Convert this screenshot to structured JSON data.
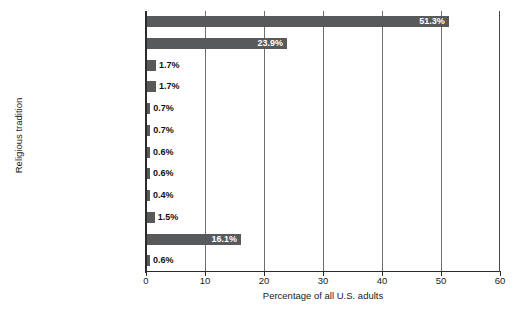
{
  "chart_data": {
    "type": "bar",
    "orientation": "horizontal",
    "title": "",
    "xlabel": "Percentage of all U.S. adults",
    "ylabel": "Religious tradition",
    "xlim": [
      0,
      60
    ],
    "xticks": [
      0,
      10,
      20,
      30,
      40,
      50,
      60
    ],
    "grid": true,
    "grid_axis": "x",
    "legend": false,
    "bar_color": "#58595b",
    "categories": [
      "Protestants",
      "Roman Catholics",
      "Mormons",
      "Jews",
      "Jehovah's Witnesses",
      "Buddhists",
      "Orthodox Christians",
      "Muslims",
      "Hindus",
      "Other faiths",
      "Unaffiliated",
      "Don't know/no answer"
    ],
    "values": [
      51.3,
      23.9,
      1.7,
      1.7,
      0.7,
      0.7,
      0.6,
      0.6,
      0.4,
      1.5,
      16.1,
      0.6
    ],
    "data_labels": [
      "51.3%",
      "23.9%",
      "1.7%",
      "1.7%",
      "0.7%",
      "0.7%",
      "0.6%",
      "0.6%",
      "0.4%",
      "1.5%",
      "16.1%",
      "0.6%"
    ],
    "label_placement": [
      "inside",
      "inside",
      "outside",
      "outside",
      "outside",
      "outside",
      "outside",
      "outside",
      "outside",
      "outside",
      "inside",
      "outside"
    ]
  }
}
